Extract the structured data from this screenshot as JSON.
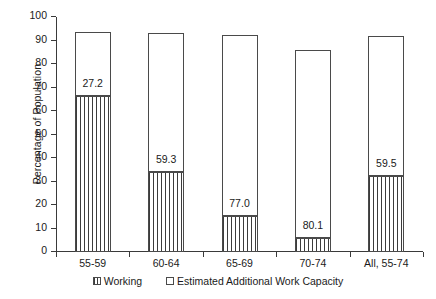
{
  "chart_data": {
    "type": "bar",
    "subtype": "stacked",
    "title": "",
    "xlabel": "",
    "ylabel": "Percentage of Population",
    "ylim": [
      0,
      100
    ],
    "yticks": [
      0,
      10,
      20,
      30,
      40,
      50,
      60,
      70,
      80,
      90,
      100
    ],
    "grid": false,
    "legend_position": "bottom",
    "categories": [
      "55-59",
      "60-64",
      "65-69",
      "70-74",
      "All, 55-74"
    ],
    "series": [
      {
        "name": "Working",
        "pattern": "vertical-lines",
        "values": [
          66.4,
          34.0,
          15.2,
          6.0,
          32.3
        ],
        "labels": [
          "",
          "",
          "",
          "",
          ""
        ]
      },
      {
        "name": "Estimated Additional Work Capacity",
        "pattern": "solid-white",
        "values": [
          27.2,
          59.3,
          77.0,
          80.1,
          59.5
        ],
        "labels": [
          "27.2",
          "59.3",
          "77.0",
          "80.1",
          "59.5"
        ]
      }
    ],
    "totals": [
      93.6,
      93.3,
      92.2,
      86.1,
      91.8
    ],
    "colors": {
      "axis": "#3a3a3a",
      "bar_outline": "#4a4a4a",
      "hatch": "#3c3c3c",
      "fill": "#ffffff",
      "text": "#1a1a1a"
    }
  },
  "legend": {
    "items": [
      {
        "label": "Working",
        "swatch": "hatched-swatch-icon"
      },
      {
        "label": "Estimated Additional Work Capacity",
        "swatch": "white-swatch-icon"
      }
    ]
  }
}
